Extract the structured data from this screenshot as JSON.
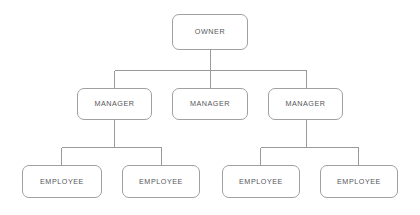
{
  "diagram": {
    "type": "organization-chart",
    "title": "",
    "background_color": "#ffffff",
    "box_border_color": "#a0a0a2",
    "connector_color": "#9a9a9c",
    "label_color": "#56565a",
    "levels": [
      {
        "name": "owner-level",
        "nodes": [
          {
            "id": "owner",
            "label": "OWNER"
          }
        ]
      },
      {
        "name": "manager-level",
        "nodes": [
          {
            "id": "manager-1",
            "label": "MANAGER"
          },
          {
            "id": "manager-2",
            "label": "MANAGER"
          },
          {
            "id": "manager-3",
            "label": "MANAGER"
          }
        ]
      },
      {
        "name": "employee-level",
        "nodes": [
          {
            "id": "employee-1",
            "label": "EMPLOYEE"
          },
          {
            "id": "employee-2",
            "label": "EMPLOYEE"
          },
          {
            "id": "employee-3",
            "label": "EMPLOYEE"
          },
          {
            "id": "employee-4",
            "label": "EMPLOYEE"
          }
        ]
      }
    ],
    "edges": [
      {
        "from": "owner",
        "to": "manager-1"
      },
      {
        "from": "owner",
        "to": "manager-2"
      },
      {
        "from": "owner",
        "to": "manager-3"
      },
      {
        "from": "manager-1",
        "to": "employee-1"
      },
      {
        "from": "manager-1",
        "to": "employee-2"
      },
      {
        "from": "manager-3",
        "to": "employee-3"
      },
      {
        "from": "manager-3",
        "to": "employee-4"
      }
    ]
  }
}
